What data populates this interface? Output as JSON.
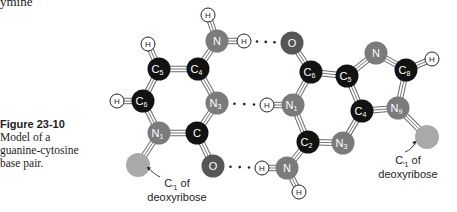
{
  "partial_heading": "ymine",
  "caption": {
    "figure_label": "Figure 23-10",
    "lines": [
      "Model of a",
      "guanine-cytosine",
      "base pair."
    ]
  },
  "colors": {
    "carbon": "#121212",
    "nitrogen": "#7b7b7b",
    "oxygen": "#565656",
    "sugar": "#a9a9a9",
    "hydrogen": "#ffffff",
    "bond": "#888888"
  },
  "atoms": [
    {
      "id": "cyt_amino_H_top",
      "el": "H",
      "label": "H",
      "x": 208,
      "y": 15
    },
    {
      "id": "cyt_amino_N",
      "el": "N",
      "label": "N",
      "sub": "",
      "x": 217,
      "y": 41
    },
    {
      "id": "cyt_amino_H_right",
      "el": "H",
      "label": "H",
      "x": 244,
      "y": 41
    },
    {
      "id": "cyt_C5_H",
      "el": "H",
      "label": "H",
      "x": 148,
      "y": 44
    },
    {
      "id": "cyt_C5",
      "el": "C",
      "label": "C",
      "sub": "5",
      "x": 159,
      "y": 69
    },
    {
      "id": "cyt_C4",
      "el": "C",
      "label": "C",
      "sub": "4",
      "x": 198,
      "y": 69
    },
    {
      "id": "cyt_C6_H",
      "el": "H",
      "label": "H",
      "x": 117,
      "y": 101
    },
    {
      "id": "cyt_C6",
      "el": "C",
      "label": "C",
      "sub": "6",
      "x": 143,
      "y": 101
    },
    {
      "id": "cyt_N3",
      "el": "N",
      "label": "N",
      "sub": "3",
      "x": 217,
      "y": 103
    },
    {
      "id": "cyt_N1",
      "el": "N",
      "label": "N",
      "sub": "1",
      "x": 159,
      "y": 133
    },
    {
      "id": "cyt_C2",
      "el": "C",
      "label": "C",
      "sub": "",
      "x": 197,
      "y": 133
    },
    {
      "id": "cyt_sugar",
      "el": "S",
      "label": "",
      "x": 138,
      "y": 165
    },
    {
      "id": "cyt_O2",
      "el": "O",
      "label": "O",
      "sub": "",
      "x": 213,
      "y": 166
    },
    {
      "id": "gua_O6",
      "el": "O",
      "label": "O",
      "sub": "",
      "x": 292,
      "y": 43
    },
    {
      "id": "gua_C6",
      "el": "C",
      "label": "C",
      "sub": "6",
      "x": 311,
      "y": 72
    },
    {
      "id": "gua_C5",
      "el": "C",
      "label": "C",
      "sub": "5",
      "x": 347,
      "y": 76
    },
    {
      "id": "gua_N7",
      "el": "N",
      "label": "N",
      "sub": "",
      "x": 376,
      "y": 53
    },
    {
      "id": "gua_C8",
      "el": "C",
      "label": "C",
      "sub": "8",
      "x": 406,
      "y": 70
    },
    {
      "id": "gua_C8_H",
      "el": "H",
      "label": "H",
      "x": 432,
      "y": 59
    },
    {
      "id": "gua_N1_H",
      "el": "H",
      "label": "H",
      "x": 267,
      "y": 105
    },
    {
      "id": "gua_N1",
      "el": "N",
      "label": "N",
      "sub": "1",
      "x": 293,
      "y": 105
    },
    {
      "id": "gua_C4",
      "el": "C",
      "label": "C",
      "sub": "4",
      "x": 362,
      "y": 111
    },
    {
      "id": "gua_N9",
      "el": "N",
      "label": "N",
      "sub": "9",
      "x": 398,
      "y": 108
    },
    {
      "id": "gua_C2",
      "el": "C",
      "label": "C",
      "sub": "2",
      "x": 308,
      "y": 142
    },
    {
      "id": "gua_N3",
      "el": "N",
      "label": "N",
      "sub": "3",
      "x": 343,
      "y": 143
    },
    {
      "id": "gua_sugar",
      "el": "S",
      "label": "",
      "x": 427,
      "y": 137
    },
    {
      "id": "gua_amino_H_left",
      "el": "H",
      "label": "H",
      "x": 262,
      "y": 168
    },
    {
      "id": "gua_amino_N",
      "el": "N",
      "label": "N",
      "sub": "",
      "x": 287,
      "y": 168
    },
    {
      "id": "gua_amino_H_bottom",
      "el": "H",
      "label": "H",
      "x": 299,
      "y": 192
    }
  ],
  "bonds": [
    [
      "cyt_amino_H_top",
      "cyt_amino_N"
    ],
    [
      "cyt_amino_N",
      "cyt_amino_H_right"
    ],
    [
      "cyt_amino_N",
      "cyt_C4"
    ],
    [
      "cyt_C5_H",
      "cyt_C5"
    ],
    [
      "cyt_C5",
      "cyt_C4"
    ],
    [
      "cyt_C5",
      "cyt_C6"
    ],
    [
      "cyt_C4",
      "cyt_N3"
    ],
    [
      "cyt_C6_H",
      "cyt_C6"
    ],
    [
      "cyt_C6",
      "cyt_N1"
    ],
    [
      "cyt_N3",
      "cyt_C2"
    ],
    [
      "cyt_N1",
      "cyt_C2"
    ],
    [
      "cyt_N1",
      "cyt_sugar"
    ],
    [
      "cyt_C2",
      "cyt_O2"
    ],
    [
      "gua_O6",
      "gua_C6"
    ],
    [
      "gua_C6",
      "gua_C5"
    ],
    [
      "gua_C6",
      "gua_N1"
    ],
    [
      "gua_C5",
      "gua_N7"
    ],
    [
      "gua_N7",
      "gua_C8"
    ],
    [
      "gua_C8",
      "gua_C8_H"
    ],
    [
      "gua_C8",
      "gua_N9"
    ],
    [
      "gua_C5",
      "gua_C4"
    ],
    [
      "gua_C4",
      "gua_N9"
    ],
    [
      "gua_C4",
      "gua_N3"
    ],
    [
      "gua_N9",
      "gua_sugar"
    ],
    [
      "gua_N1_H",
      "gua_N1"
    ],
    [
      "gua_N1",
      "gua_C2"
    ],
    [
      "gua_C2",
      "gua_N3"
    ],
    [
      "gua_C2",
      "gua_amino_N"
    ],
    [
      "gua_amino_H_left",
      "gua_amino_N"
    ],
    [
      "gua_amino_N",
      "gua_amino_H_bottom"
    ]
  ],
  "hydrogen_bonds": [
    {
      "from": "cyt_amino_H_right",
      "to": "gua_O6",
      "dots": "· · ·"
    },
    {
      "from": "cyt_N3",
      "to": "gua_N1_H",
      "dots": "· · ·"
    },
    {
      "from": "cyt_O2",
      "to": "gua_amino_H_left",
      "dots": "· · ·"
    }
  ],
  "annotations": [
    {
      "id": "cyt_sugar_label",
      "line1": "C",
      "prime_sub": "′1",
      "line1_rest": " of",
      "line2": "deoxyribose",
      "x": 177,
      "y": 187,
      "arrow_from": [
        160,
        177
      ],
      "arrow_to": [
        147,
        167
      ]
    },
    {
      "id": "gua_sugar_label",
      "line1": "C",
      "prime_sub": "′1",
      "line1_rest": " of",
      "line2": "deoxyribose",
      "x": 408,
      "y": 164,
      "arrow_from": [
        405,
        152
      ],
      "arrow_to": [
        416,
        141
      ]
    }
  ]
}
